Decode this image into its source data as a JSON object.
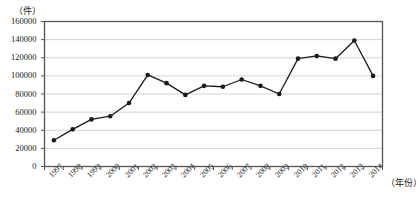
{
  "chart_data": {
    "type": "line",
    "title": "",
    "subtitle": "",
    "xlabel": "（年份）",
    "ylabel": "（件）",
    "ylim": [
      0,
      160000
    ],
    "ytick_step": 20000,
    "grid": true,
    "legend": "none",
    "marker": "filled-circle",
    "line_color": "#1a1a1a",
    "grid_color": "#c8c8c8",
    "axis_color": "#555555",
    "categories": [
      "1997",
      "1998",
      "1999",
      "2000",
      "2001",
      "2002",
      "2003",
      "2004",
      "2005",
      "2006",
      "2007",
      "2008",
      "2009",
      "2010",
      "2011",
      "2012",
      "2013",
      "2014"
    ],
    "ytick_labels": [
      "0",
      "20000",
      "40000",
      "60000",
      "80000",
      "100000",
      "120000",
      "140000",
      "160000"
    ],
    "ytick_values": [
      0,
      20000,
      40000,
      60000,
      80000,
      100000,
      120000,
      140000,
      160000
    ],
    "series": [
      {
        "name": "件数",
        "values": [
          29000,
          41000,
          52000,
          55500,
          70000,
          101000,
          92000,
          79000,
          89000,
          88000,
          96000,
          89000,
          80000,
          119000,
          122000,
          119000,
          139000,
          100000
        ]
      }
    ]
  },
  "axes": {
    "y_unit_label": "（件）",
    "x_unit_label": "（年份）"
  }
}
